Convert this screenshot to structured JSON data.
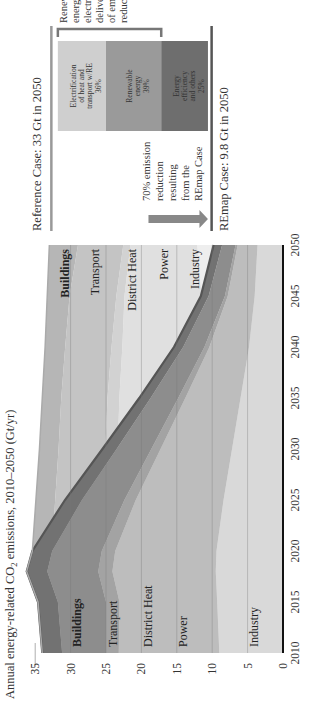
{
  "chart_data": {
    "type": "area",
    "title": "Annual energy-related CO2 emissions, 2010–2050 (Gt/yr)",
    "title_parts": {
      "pre": "Annual energy-related CO",
      "sub": "2",
      "post": " emissions, 2010–2050 (Gt/yr)"
    },
    "xlabel": "",
    "ylabel": "Gt/yr",
    "x": [
      2010,
      2015,
      2018,
      2020,
      2025,
      2030,
      2035,
      2040,
      2045,
      2050
    ],
    "xticks": [
      "2010",
      "2015",
      "2020",
      "2025",
      "2030",
      "2035",
      "2040",
      "2045",
      "2050"
    ],
    "yticks": [
      "0",
      "5",
      "10",
      "15",
      "20",
      "25",
      "30",
      "35"
    ],
    "ylim": [
      0,
      35
    ],
    "xlim": [
      2010,
      2050
    ],
    "grid": true,
    "stacking": "stacked",
    "series": [
      {
        "name": "Industry",
        "values": [
          9.0,
          9.3,
          9.5,
          9.4,
          8.4,
          7.2,
          6.0,
          4.8,
          4.0,
          3.6
        ]
      },
      {
        "name": "Power",
        "values": [
          14.2,
          13.8,
          14.6,
          14.3,
          12.4,
          10.1,
          7.8,
          5.6,
          3.8,
          2.8
        ]
      },
      {
        "name": "District Heat",
        "values": [
          1.8,
          1.9,
          2.0,
          1.9,
          1.6,
          1.3,
          1.0,
          0.7,
          0.4,
          0.3
        ]
      },
      {
        "name": "Transport",
        "values": [
          6.2,
          6.8,
          7.2,
          7.0,
          6.0,
          4.9,
          3.9,
          3.0,
          2.3,
          1.9
        ]
      },
      {
        "name": "Buildings",
        "values": [
          2.8,
          2.8,
          2.9,
          2.8,
          2.4,
          2.0,
          1.6,
          1.3,
          1.1,
          1.2
        ]
      }
    ],
    "reference_total": [
      34.0,
      34.6,
      36.2,
      35.4,
      34.9,
      34.4,
      34.0,
      33.6,
      33.3,
      33.0
    ],
    "remap_total": [
      34.0,
      34.6,
      36.2,
      35.4,
      30.8,
      25.5,
      20.3,
      15.4,
      11.6,
      9.8
    ],
    "annotations": {
      "reference_case": "Reference Case: 33 Gt in 2050",
      "remap_case": "REmap Case: 9.8 Gt in 2050",
      "reduction_note": [
        "70% emission",
        "reduction",
        "resulting",
        "from the",
        "REmap Case"
      ],
      "bracket_note": [
        "Renewable",
        "energy and",
        "electrification",
        "deliver 75%",
        "of emission",
        "reductions"
      ],
      "breakdown": [
        {
          "label": [
            "Electrification",
            "of heat and",
            "transport w/RE"
          ],
          "share": "36%",
          "color": "#cfcfcf"
        },
        {
          "label": [
            "Renewable",
            "energy"
          ],
          "share": "39%",
          "color": "#9a9a9a"
        },
        {
          "label": [
            "Energy",
            "efficiency",
            "and others"
          ],
          "share": "25%",
          "color": "#6e6e6e"
        }
      ]
    },
    "legend": {
      "position": "inline labels at 2010 and 2050"
    }
  },
  "labels_left": [
    "Buildings",
    "Transport",
    "District Heat",
    "Power",
    "Industry"
  ],
  "labels_right": [
    "Buildings",
    "Transport",
    "District Heat",
    "Power",
    "Industry"
  ]
}
